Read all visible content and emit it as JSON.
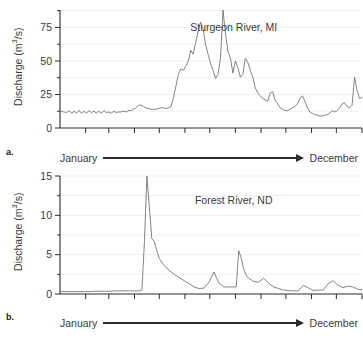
{
  "figure": {
    "panels": [
      {
        "letter": "a.",
        "ylabel_text": "Discharge (m",
        "ylabel_sup": "3",
        "ylabel_tail": "/s)",
        "title": "Sturgeon River, MI",
        "x_start_label": "January",
        "x_end_label": "December"
      },
      {
        "letter": "b.",
        "ylabel_text": "Discharge (m",
        "ylabel_sup": "3",
        "ylabel_tail": "/s)",
        "title": "Forest River, ND",
        "x_start_label": "January",
        "x_end_label": "December"
      }
    ]
  },
  "colors": {
    "line": "#6e6e72",
    "axis": "#2b2b2b",
    "grid": "#efeff1",
    "text": "#3b3b3b",
    "background": "#ffffff"
  },
  "chart_data": [
    {
      "type": "line",
      "title": "Sturgeon River, MI",
      "panel": "a",
      "xlabel": "",
      "ylabel": "Discharge (m3/s)",
      "xlim": [
        0,
        365
      ],
      "ylim": [
        0,
        88
      ],
      "yticks": [
        0,
        25,
        50,
        75
      ],
      "yticklabels": [
        "0",
        "25",
        "50",
        "75"
      ],
      "yminorticks": [
        12.5,
        37.5,
        62.5,
        87.5
      ],
      "xticks": [
        0,
        31,
        59,
        90,
        120,
        151,
        181,
        212,
        243,
        273,
        304,
        334,
        365
      ],
      "xticklabels": [
        "January",
        "",
        "",
        "",
        "",
        "",
        "",
        "",
        "",
        "",
        "",
        "",
        "December"
      ],
      "grid": true,
      "legend": "none",
      "axis_arrow": "January to December",
      "x": [
        0,
        4,
        8,
        11,
        14,
        17,
        20,
        23,
        26,
        29,
        32,
        35,
        38,
        41,
        44,
        47,
        50,
        53,
        56,
        59,
        62,
        65,
        68,
        71,
        74,
        77,
        80,
        83,
        86,
        89,
        92,
        95,
        98,
        101,
        104,
        107,
        110,
        113,
        116,
        119,
        122,
        125,
        128,
        131,
        134,
        137,
        140,
        143,
        146,
        149,
        152,
        155,
        158,
        161,
        164,
        167,
        170,
        173,
        176,
        179,
        182,
        185,
        188,
        191,
        194,
        197,
        200,
        203,
        206,
        209,
        212,
        215,
        218,
        221,
        224,
        227,
        230,
        233,
        236,
        239,
        242,
        245,
        248,
        251,
        254,
        257,
        260,
        263,
        266,
        269,
        272,
        275,
        278,
        281,
        284,
        287,
        290,
        293,
        296,
        299,
        302,
        305,
        308,
        311,
        314,
        317,
        320,
        323,
        326,
        329,
        332,
        335,
        338,
        341,
        344,
        347,
        350,
        353,
        356,
        359,
        362,
        365
      ],
      "y": [
        13,
        12,
        11.5,
        13,
        11,
        12.5,
        11,
        13,
        11,
        12.5,
        11,
        13,
        11.5,
        12.5,
        11,
        12.5,
        11,
        13,
        11.5,
        12,
        11,
        12.5,
        11.5,
        12,
        12,
        12.5,
        12,
        13,
        13,
        14,
        15,
        17,
        17,
        16,
        15,
        14.5,
        14,
        14,
        14,
        14.5,
        15,
        15,
        14.5,
        15,
        16,
        22,
        31,
        40,
        44,
        43,
        46,
        50,
        58,
        55,
        64,
        72,
        79,
        74,
        62,
        55,
        48,
        43,
        37,
        40,
        52,
        88,
        70,
        57,
        52,
        41,
        50,
        45,
        38,
        40,
        52,
        49,
        43,
        38,
        30,
        26,
        24,
        22,
        21,
        20,
        26,
        27,
        21,
        18,
        15,
        14,
        13,
        13,
        14,
        15,
        16,
        18,
        22,
        24,
        20,
        15,
        12,
        11,
        10,
        9.5,
        9,
        9,
        9.5,
        10,
        11,
        13,
        12,
        13,
        15,
        18,
        19,
        16,
        15,
        17,
        38,
        28,
        22,
        23,
        24,
        26,
        31,
        27,
        22,
        20,
        18,
        16,
        15
      ],
      "annotations": [
        {
          "text": "Sturgeon River, MI",
          "x": 210,
          "y": 72
        }
      ]
    },
    {
      "type": "line",
      "title": "Forest River, ND",
      "panel": "b",
      "xlabel": "",
      "ylabel": "Discharge (m3/s)",
      "xlim": [
        0,
        365
      ],
      "ylim": [
        0,
        15
      ],
      "yticks": [
        0,
        5,
        10,
        15
      ],
      "yticklabels": [
        "0",
        "5",
        "10",
        "15"
      ],
      "yminorticks": [
        2.5,
        7.5,
        12.5
      ],
      "xticks": [
        0,
        31,
        59,
        90,
        120,
        151,
        181,
        212,
        243,
        273,
        304,
        334,
        365
      ],
      "xticklabels": [
        "January",
        "",
        "",
        "",
        "",
        "",
        "",
        "",
        "",
        "",
        "",
        "",
        "December"
      ],
      "grid": true,
      "legend": "none",
      "axis_arrow": "January to December",
      "x": [
        0,
        6,
        12,
        18,
        24,
        30,
        36,
        42,
        48,
        54,
        60,
        66,
        72,
        78,
        84,
        90,
        96,
        99,
        102,
        105,
        108,
        111,
        114,
        117,
        120,
        126,
        132,
        138,
        144,
        150,
        156,
        162,
        168,
        174,
        180,
        186,
        192,
        198,
        204,
        210,
        213,
        216,
        219,
        222,
        225,
        228,
        234,
        240,
        246,
        252,
        258,
        264,
        270,
        276,
        282,
        288,
        294,
        300,
        306,
        312,
        318,
        324,
        330,
        336,
        342,
        348,
        354,
        360,
        365
      ],
      "y": [
        0.3,
        0.3,
        0.3,
        0.3,
        0.3,
        0.3,
        0.3,
        0.35,
        0.35,
        0.35,
        0.35,
        0.4,
        0.4,
        0.4,
        0.4,
        0.4,
        0.4,
        0.5,
        6.5,
        15,
        11,
        7,
        6.7,
        5.5,
        4.5,
        3.6,
        3.0,
        2.5,
        2.1,
        1.7,
        1.3,
        0.9,
        0.7,
        0.75,
        1.5,
        2.8,
        1.4,
        0.9,
        0.9,
        0.9,
        0.9,
        5.5,
        4.6,
        3.2,
        2.4,
        2.0,
        1.6,
        1.5,
        2.0,
        1.4,
        0.9,
        0.7,
        0.5,
        0.45,
        0.4,
        0.4,
        1.1,
        0.8,
        0.45,
        0.5,
        0.5,
        1.3,
        1.7,
        1.1,
        0.8,
        1.0,
        0.9,
        0.6,
        0.55
      ],
      "annotations": [
        {
          "text": "Forest River, ND",
          "x": 210,
          "y": 11.5
        }
      ]
    }
  ]
}
